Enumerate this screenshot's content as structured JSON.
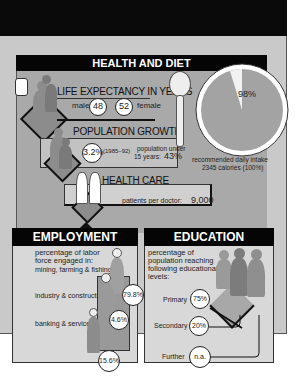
{
  "health_and_diet": {
    "title": "HEALTH AND DIET",
    "life_expectancy": {
      "heading": "LIFE EXPECTANCY IN YEARS",
      "male_label": "male",
      "male_value": "48",
      "female_value": "52",
      "female_label": "female"
    },
    "population_growth": {
      "heading": "POPULATION GROWTH",
      "rate": "3.2%",
      "period": "(1985–92)",
      "under15_label_line1": "population under",
      "under15_label_line2": "15 years:",
      "under15_value": "43%"
    },
    "health_care": {
      "heading": "HEALTH CARE",
      "doctor_label": "patients per doctor:",
      "doctor_value": "9,000"
    },
    "diet": {
      "pie_value": "98%",
      "caption_line1": "recommended daily intake",
      "caption_line2": "2345 calories (100%)"
    }
  },
  "employment": {
    "title": "EMPLOYMENT",
    "intro_line1": "percentage of labor",
    "intro_line2": "force engaged in:",
    "sectors": [
      {
        "label": "mining, farming & fishing",
        "value": "79.8%"
      },
      {
        "label": "industry & construction",
        "value": "4.6%"
      },
      {
        "label": "banking & services",
        "value": "15.6%"
      }
    ]
  },
  "education": {
    "title": "EDUCATION",
    "intro_line1": "percentage of",
    "intro_line2": "population reaching",
    "intro_line3": "following educational",
    "intro_line4": "levels:",
    "levels": [
      {
        "label": "Primary",
        "value": "75%"
      },
      {
        "label": "Secondary",
        "value": "20%"
      },
      {
        "label": "Further",
        "value": "n.a."
      }
    ]
  },
  "colors": {
    "black": "#050505",
    "frame_gray": "#c9c9c9",
    "panel_gray": "#a9a9a9",
    "light_panel": "#d8d8d8",
    "figure_gray": "#8c8c8c"
  }
}
